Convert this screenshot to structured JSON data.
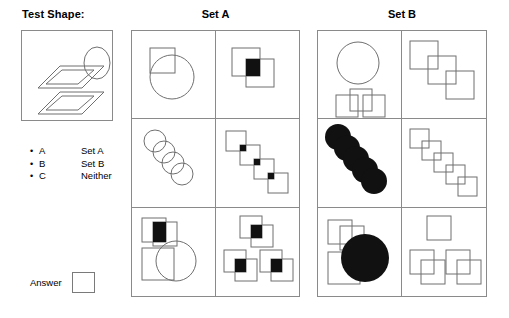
{
  "test_shape": {
    "title": "Test Shape:",
    "description": "two overlapping parallelograms and an ellipse",
    "elements": [
      {
        "shape": "parallelogram-outer",
        "style": "outline"
      },
      {
        "shape": "parallelogram-inner",
        "style": "outline"
      },
      {
        "shape": "parallelogram-outer-lower",
        "style": "outline"
      },
      {
        "shape": "parallelogram-inner-lower",
        "style": "outline"
      },
      {
        "shape": "ellipse",
        "style": "outline"
      }
    ]
  },
  "legend": {
    "items": [
      {
        "bullet": "•",
        "key": "A",
        "value": "Set A"
      },
      {
        "bullet": "•",
        "key": "B",
        "value": "Set B"
      },
      {
        "bullet": "•",
        "key": "C",
        "value": "Neither"
      }
    ]
  },
  "answer": {
    "label": "Answer",
    "value": "",
    "placeholder": ""
  },
  "sets": [
    {
      "title": "Set A",
      "cells": [
        {
          "id": "a1",
          "description": "square overlapping circle, outlines only"
        },
        {
          "id": "a2",
          "description": "two overlapping squares with black filled overlap"
        },
        {
          "id": "a3",
          "description": "four overlapping circles in a diagonal chain"
        },
        {
          "id": "a4",
          "description": "four overlapping squares in a diagonal chain with black filled overlaps"
        },
        {
          "id": "a5",
          "description": "two overlapping squares with black overlap, plus square and circle"
        },
        {
          "id": "a6",
          "description": "three pairs of overlapping squares each with black filled overlap"
        }
      ]
    },
    {
      "title": "Set B",
      "cells": [
        {
          "id": "b1",
          "description": "circle above three overlapping squares, outlines only"
        },
        {
          "id": "b2",
          "description": "three overlapping squares in a diagonal chain, outlines only"
        },
        {
          "id": "b3",
          "description": "five overlapping solid black circles in a diagonal chain"
        },
        {
          "id": "b4",
          "description": "five overlapping squares in a diagonal chain, outlines only"
        },
        {
          "id": "b5",
          "description": "two overlapping squares, a square, and a large solid black circle"
        },
        {
          "id": "b6",
          "description": "one square plus two pairs of overlapping squares, outlines only"
        }
      ]
    }
  ],
  "colors": {
    "stroke": "#6f6f6f",
    "fill_solid": "#111111",
    "border": "#8a8a8a",
    "background": "#ffffff",
    "text": "#000000"
  }
}
